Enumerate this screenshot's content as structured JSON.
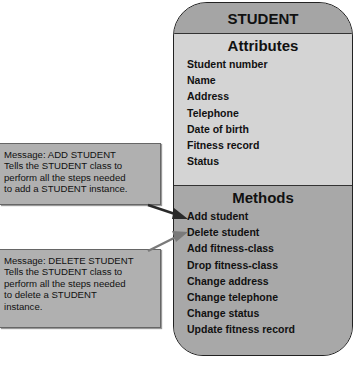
{
  "class_box": {
    "title": "STUDENT",
    "attributes": {
      "heading": "Attributes",
      "items": [
        "Student number",
        "Name",
        "Address",
        "Telephone",
        "Date of birth",
        "Fitness record",
        "Status"
      ]
    },
    "methods": {
      "heading": "Methods",
      "items": [
        "Add student",
        "Delete student",
        "Add fitness-class",
        "Drop fitness-class",
        "Change address",
        "Change telephone",
        "Change status",
        "Update fitness record"
      ]
    }
  },
  "messages": [
    {
      "title": "Message: ADD STUDENT",
      "lines": [
        "Tells the STUDENT class to",
        "perform all the steps needed",
        "to add a STUDENT instance."
      ],
      "target": "Add student",
      "arrow_color": "#2a2a2a"
    },
    {
      "title": "Message: DELETE STUDENT",
      "lines": [
        "Tells the STUDENT class to",
        "perform all the steps needed",
        "to delete a STUDENT",
        "instance."
      ],
      "target": "Delete student",
      "arrow_color": "#7a7a7a"
    }
  ],
  "colors": {
    "header_bg": "#a5a5a5",
    "attributes_bg": "#d4d4d4",
    "methods_bg": "#a8a8a8",
    "message_bg": "#b0b0b0"
  }
}
